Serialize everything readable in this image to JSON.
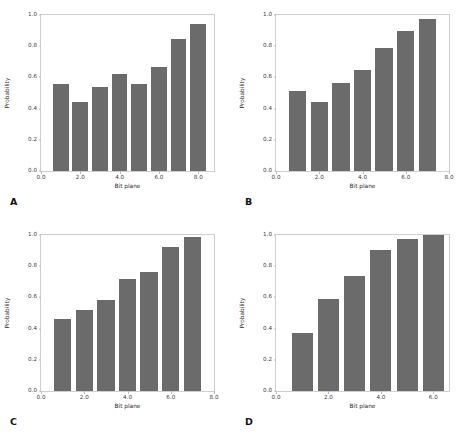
{
  "figure": {
    "background": "#ffffff",
    "bar_color": "#6b6b6b",
    "axis_color": "#cfcfcf",
    "panel_count": 4
  },
  "chart_data": [
    {
      "type": "bar",
      "panel": "A",
      "title": "",
      "xlabel": "Bit plane",
      "ylabel": "Probability",
      "x": [
        1,
        2,
        3,
        4,
        5,
        6,
        7,
        8
      ],
      "values": [
        0.555,
        0.445,
        0.54,
        0.62,
        0.555,
        0.665,
        0.845,
        0.94
      ],
      "categories": [
        "1",
        "2",
        "3",
        "4",
        "5",
        "6",
        "7",
        "8"
      ],
      "xlim": [
        0.0,
        8.8
      ],
      "ylim": [
        0.0,
        1.0
      ],
      "xticks": [
        "0.0",
        "2.0",
        "4.0",
        "6.0",
        "8.0"
      ],
      "xtick_values": [
        0.0,
        2.0,
        4.0,
        6.0,
        8.0
      ],
      "yticks": [
        "0.0",
        "0.2",
        "0.4",
        "0.6",
        "0.8",
        "1.0"
      ],
      "ytick_values": [
        0.0,
        0.2,
        0.4,
        0.6,
        0.8,
        1.0
      ],
      "grid": false,
      "legend": null
    },
    {
      "type": "bar",
      "panel": "B",
      "title": "",
      "xlabel": "Bit plane",
      "ylabel": "Probability",
      "x": [
        1,
        2,
        3,
        4,
        5,
        6,
        7
      ],
      "values": [
        0.515,
        0.445,
        0.565,
        0.65,
        0.79,
        0.9,
        0.975
      ],
      "categories": [
        "1",
        "2",
        "3",
        "4",
        "5",
        "6",
        "7"
      ],
      "xlim": [
        0.0,
        8.0
      ],
      "ylim": [
        0.0,
        1.0
      ],
      "xticks": [
        "0.0",
        "2.0",
        "4.0",
        "6.0",
        "8.0"
      ],
      "xtick_values": [
        0.0,
        2.0,
        4.0,
        6.0,
        8.0
      ],
      "yticks": [
        "0.0",
        "0.2",
        "0.4",
        "0.6",
        "0.8",
        "1.0"
      ],
      "ytick_values": [
        0.0,
        0.2,
        0.4,
        0.6,
        0.8,
        1.0
      ],
      "grid": false,
      "legend": null
    },
    {
      "type": "bar",
      "panel": "C",
      "title": "",
      "xlabel": "Bit plane",
      "ylabel": "Probability",
      "x": [
        1,
        2,
        3,
        4,
        5,
        6,
        7
      ],
      "values": [
        0.46,
        0.52,
        0.585,
        0.715,
        0.76,
        0.92,
        0.985
      ],
      "categories": [
        "1",
        "2",
        "3",
        "4",
        "5",
        "6",
        "7"
      ],
      "xlim": [
        0.0,
        8.0
      ],
      "ylim": [
        0.0,
        1.0
      ],
      "xticks": [
        "0.0",
        "2.0",
        "4.0",
        "6.0",
        "8.0"
      ],
      "xtick_values": [
        0.0,
        2.0,
        4.0,
        6.0,
        8.0
      ],
      "yticks": [
        "0.0",
        "0.2",
        "0.4",
        "0.6",
        "0.8",
        "1.0"
      ],
      "ytick_values": [
        0.0,
        0.2,
        0.4,
        0.6,
        0.8,
        1.0
      ],
      "grid": false,
      "legend": null
    },
    {
      "type": "bar",
      "panel": "D",
      "title": "",
      "xlabel": "Bit plane",
      "ylabel": "Probability",
      "x": [
        1,
        2,
        3,
        4,
        5,
        6
      ],
      "values": [
        0.375,
        0.59,
        0.735,
        0.905,
        0.975,
        1.0
      ],
      "categories": [
        "1",
        "2",
        "3",
        "4",
        "5",
        "6"
      ],
      "xlim": [
        0.0,
        6.6
      ],
      "ylim": [
        0.0,
        1.0
      ],
      "xticks": [
        "0.0",
        "2.0",
        "4.0",
        "6.0"
      ],
      "xtick_values": [
        0.0,
        2.0,
        4.0,
        6.0
      ],
      "yticks": [
        "0.0",
        "0.2",
        "0.4",
        "0.6",
        "0.8",
        "1.0"
      ],
      "ytick_values": [
        0.0,
        0.2,
        0.4,
        0.6,
        0.8,
        1.0
      ],
      "grid": false,
      "legend": null
    }
  ],
  "panel_labels": [
    "A",
    "B",
    "C",
    "D"
  ]
}
